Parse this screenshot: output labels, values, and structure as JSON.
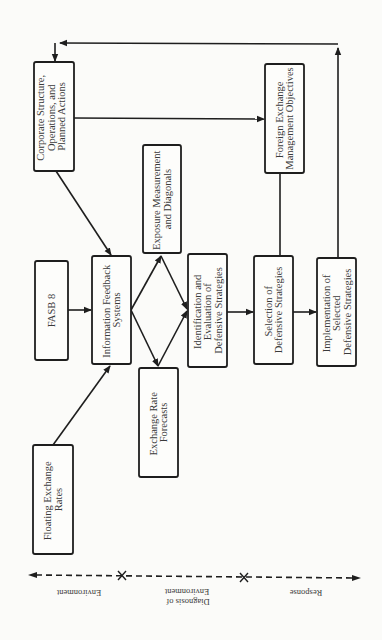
{
  "diagram": {
    "boxes": {
      "corporate": [
        "Corporate Structure,",
        "Operations, and",
        "Planned Actions"
      ],
      "fx_objectives": [
        "Foreign Exchange",
        "Management Objectives"
      ],
      "exposure": [
        "Exposure Measurement",
        "and Diagonals"
      ],
      "fasb": [
        "FASB 8"
      ],
      "info_feedback": [
        "Information Feedback",
        "Systems"
      ],
      "identification": [
        "Identification and",
        "Evaluation of",
        "Defensive Strategies"
      ],
      "selection": [
        "Selection of",
        "Defensive Strategies"
      ],
      "implementation": [
        "Implementation of",
        "Selected",
        "Defensive Strategies"
      ],
      "forecasts": [
        "Exchange Rate",
        "Forecasts"
      ],
      "floating": [
        "Floating Exchange",
        "Rates"
      ]
    },
    "axis": {
      "segments": [
        [
          "Environment"
        ],
        [
          "Diagnosis of",
          "Environment"
        ],
        [
          "Response"
        ]
      ]
    },
    "edges": [
      {
        "from": "floating",
        "to": "info_feedback"
      },
      {
        "from": "fasb",
        "to": "info_feedback"
      },
      {
        "from": "corporate",
        "to": "info_feedback"
      },
      {
        "from": "corporate",
        "to": "fx_objectives"
      },
      {
        "from": "info_feedback",
        "to": "exposure"
      },
      {
        "from": "info_feedback",
        "to": "forecasts"
      },
      {
        "from": "exposure",
        "to": "identification"
      },
      {
        "from": "forecasts",
        "to": "identification"
      },
      {
        "from": "identification",
        "to": "selection"
      },
      {
        "from": "fx_objectives",
        "to": "selection"
      },
      {
        "from": "selection",
        "to": "implementation"
      },
      {
        "from": "implementation",
        "to": "corporate",
        "label": "feedback loop"
      }
    ]
  }
}
